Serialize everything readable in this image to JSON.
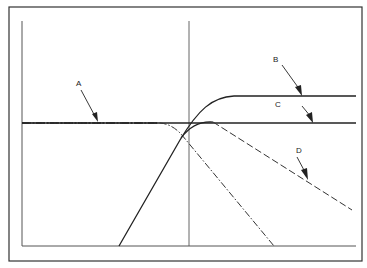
{
  "diagram": {
    "type": "filter-response-curves",
    "frame": {
      "x": 9,
      "y": 7,
      "width": 353,
      "height": 254
    },
    "axes": {
      "left_x": 22,
      "top_y": 21,
      "bottom_y": 246,
      "right_x": 356,
      "center_x": 189
    },
    "reference_level_y": 123,
    "labels": [
      {
        "id": "A",
        "text": "A",
        "x": 76,
        "y": 86
      },
      {
        "id": "B",
        "text": "B",
        "x": 273,
        "y": 62
      },
      {
        "id": "C",
        "text": "C",
        "x": 275,
        "y": 107
      },
      {
        "id": "D",
        "text": "D",
        "x": 296,
        "y": 153
      }
    ],
    "curves": [
      {
        "id": "A",
        "style": "dash-dot",
        "description": "low-pass: flat then rolls off",
        "path": "M22,123 L160,123 C172,124 180,132 186,140 L274,246"
      },
      {
        "id": "B",
        "style": "solid",
        "description": "high-pass: rises then flat at upper level",
        "path": "M119,246 L180,140 C198,110 212,97 234,96 L356,96"
      },
      {
        "id": "C",
        "style": "solid",
        "description": "flat reference line",
        "path": "M22,123 L356,123"
      },
      {
        "id": "D",
        "style": "dashed",
        "description": "band-pass: rises, peaks, then gentle roll-off",
        "path": "M181,138 C190,126 200,121 213,122 L352,210"
      }
    ]
  }
}
